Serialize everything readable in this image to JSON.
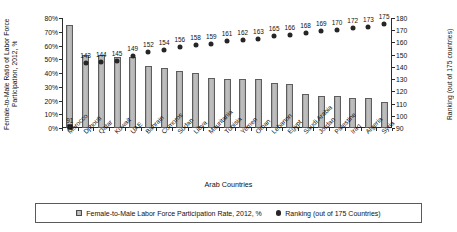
{
  "chart_data": {
    "type": "bar",
    "title": "",
    "xlabel": "Arab Countries",
    "ylabel": "Female-to-Male Ratio of Labor Force Participation, 2012, %",
    "y2label": "Ranking (out of 175 countries)",
    "grid": false,
    "legend_position": "bottom",
    "categories": [
      "Morocco",
      "Djibouti",
      "Qatar",
      "Kuwait",
      "UAE",
      "Bahrain",
      "Comoros",
      "Sudan",
      "Libya",
      "Mauritania",
      "Tunisia",
      "Yemen",
      "Oman",
      "Lebanon",
      "Egypt",
      "Saudi Arabia",
      "Jordan",
      "Palestine",
      "Iraq",
      "Algeria",
      "Syria"
    ],
    "ylim": [
      0,
      80
    ],
    "yticks": [
      "0%",
      "10%",
      "20%",
      "30%",
      "40%",
      "50%",
      "60%",
      "70%",
      "80%"
    ],
    "y2lim": [
      90,
      180
    ],
    "y2ticks": [
      "90",
      "100",
      "110",
      "120",
      "130",
      "140",
      "150",
      "160",
      "170",
      "180"
    ],
    "series": [
      {
        "name": "Female-to-Male Labor Force Participation Rate, 2012, %",
        "type": "bar",
        "axis": "left",
        "values": [
          75,
          53,
          53,
          52,
          52,
          45,
          43.5,
          41.5,
          40,
          36.5,
          36,
          35.5,
          35.5,
          33,
          32,
          24.5,
          23.5,
          23.5,
          21.5,
          21.5,
          19
        ]
      },
      {
        "name": "Ranking (out of 175 Countries)",
        "type": "scatter",
        "axis": "right",
        "values": [
          91,
          143,
          144,
          145,
          149,
          152,
          154,
          156,
          158,
          159,
          161,
          162,
          163,
          165,
          166,
          168,
          169,
          170,
          172,
          173,
          175
        ],
        "point_labels": [
          "91",
          "143",
          "144",
          "145",
          "149",
          "152",
          "154",
          "156",
          "158",
          "159",
          "161",
          "162",
          "163",
          "165",
          "166",
          "168",
          "169",
          "170",
          "172",
          "173",
          "175"
        ]
      }
    ],
    "legend": [
      {
        "label": "Female-to-Male Labor Force Participation Rate, 2012, %",
        "marker": "square-swatch"
      },
      {
        "label": "Ranking (out of 175 Countries)",
        "marker": "filled-circle"
      }
    ]
  }
}
